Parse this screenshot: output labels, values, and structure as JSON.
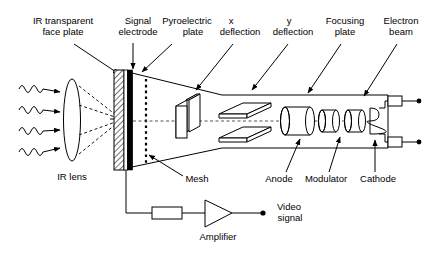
{
  "figure": {
    "background_color": "#ffffff",
    "line_color": "#000000"
  },
  "labels_top": [
    {
      "id": "ir-face-plate",
      "line1": "IR transparent",
      "line2": "face plate"
    },
    {
      "id": "signal-electrode",
      "line1": "Signal",
      "line2": "electrode"
    },
    {
      "id": "pyroelectric-plate",
      "line1": "Pyroelectric",
      "line2": "plate"
    },
    {
      "id": "x-deflection",
      "line1": "x",
      "line2": "deflection"
    },
    {
      "id": "y-deflection",
      "line1": "y",
      "line2": "deflection"
    },
    {
      "id": "focusing-plate",
      "line1": "Focusing",
      "line2": "plate"
    },
    {
      "id": "electron-beam",
      "line1": "Electron",
      "line2": "beam"
    }
  ],
  "labels_bottom": [
    {
      "id": "ir-lens",
      "text": "IR lens"
    },
    {
      "id": "mesh",
      "text": "Mesh"
    },
    {
      "id": "anode",
      "text": "Anode"
    },
    {
      "id": "modulator",
      "text": "Modulator"
    },
    {
      "id": "cathode",
      "text": "Cathode"
    }
  ],
  "circuit": {
    "amplifier_label": "Amplifier",
    "output_line1": "Video",
    "output_line2": "signal"
  },
  "components": {
    "ir_wave_count": 4,
    "mesh_dot_count": 16,
    "cathode_coil_loops": 3,
    "terminal_count": 2
  }
}
